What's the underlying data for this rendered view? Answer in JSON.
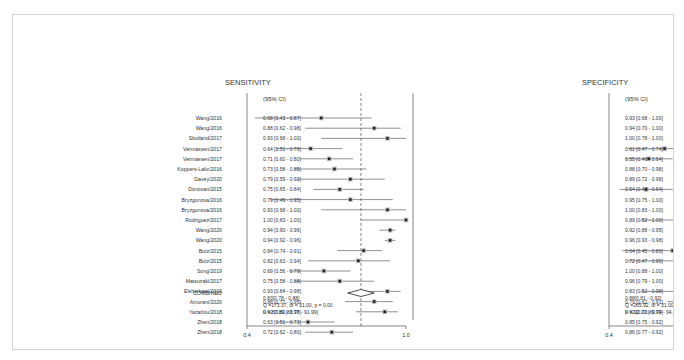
{
  "chart_data": {
    "type": "forest",
    "panels": [
      {
        "title": "SENSITIVITY",
        "ci_header": "(95% CI)",
        "xlim": [
          0.4,
          1.0
        ],
        "xticks": [
          "0.4",
          "1.0"
        ],
        "reference_line": 0.83,
        "studies": [
          {
            "label": "Wang/2016",
            "est": 0.68,
            "lo": 0.43,
            "hi": 0.87,
            "text": "0.68 [0.43 - 0.87]"
          },
          {
            "label": "Wang/2016",
            "est": 0.88,
            "lo": 0.62,
            "hi": 0.98,
            "text": "0.88 [0.62 - 0.98]"
          },
          {
            "label": "Skotland/2017",
            "est": 0.93,
            "lo": 0.68,
            "hi": 1.0,
            "text": "0.93 [0.68 - 1.00]"
          },
          {
            "label": "Vermassen/2017",
            "est": 0.64,
            "lo": 0.51,
            "hi": 0.76,
            "text": "0.64 [0.51 - 0.76]"
          },
          {
            "label": "Vermassen/2017",
            "est": 0.71,
            "lo": 0.6,
            "hi": 0.8,
            "text": "0.71 [0.60 - 0.80]"
          },
          {
            "label": "Koppers-Lalic/2016",
            "est": 0.73,
            "lo": 0.58,
            "hi": 0.85,
            "text": "0.73 [0.58 - 0.85]"
          },
          {
            "label": "Davey/2020",
            "est": 0.79,
            "lo": 0.59,
            "hi": 0.92,
            "text": "0.79 [0.59 - 0.92]"
          },
          {
            "label": "Donovan/2015",
            "est": 0.75,
            "lo": 0.65,
            "hi": 0.84,
            "text": "0.75 [0.65 - 0.84]"
          },
          {
            "label": "Bryzgunova/2016",
            "est": 0.79,
            "lo": 0.49,
            "hi": 0.95,
            "text": "0.79 [0.49 - 0.95]"
          },
          {
            "label": "Bryzgunova/2016",
            "est": 0.93,
            "lo": 0.68,
            "hi": 1.0,
            "text": "0.93 [0.68 - 1.00]"
          },
          {
            "label": "Rodriguez/2017",
            "est": 1.0,
            "lo": 0.83,
            "hi": 1.0,
            "text": "1.00 [0.83 - 1.00]"
          },
          {
            "label": "Wang/2020",
            "est": 0.94,
            "lo": 0.9,
            "hi": 0.96,
            "text": "0.94 [0.90 - 0.96]"
          },
          {
            "label": "Wang/2020",
            "est": 0.94,
            "lo": 0.92,
            "hi": 0.96,
            "text": "0.94 [0.92 - 0.96]"
          },
          {
            "label": "Butz/2015",
            "est": 0.84,
            "lo": 0.74,
            "hi": 0.91,
            "text": "0.84 [0.74 - 0.91]"
          },
          {
            "label": "Butz/2015",
            "est": 0.82,
            "lo": 0.63,
            "hi": 0.94,
            "text": "0.82 [0.63 - 0.94]"
          },
          {
            "label": "Song/2019",
            "est": 0.69,
            "lo": 0.56,
            "hi": 0.79,
            "text": "0.69 [0.56 - 0.79]"
          },
          {
            "label": "Matsuzaki/2017",
            "est": 0.75,
            "lo": 0.58,
            "hi": 0.88,
            "text": "0.75 [0.58 - 0.88]"
          },
          {
            "label": "Elsharkawi/2019",
            "est": 0.93,
            "lo": 0.84,
            "hi": 0.98,
            "text": "0.93 [0.84 - 0.98]"
          },
          {
            "label": "Amurani/2020",
            "est": 0.88,
            "lo": 0.77,
            "hi": 0.95,
            "text": "0.88 [0.77 - 0.95]"
          },
          {
            "label": "Yazarlou/2018",
            "est": 0.92,
            "lo": 0.81,
            "hi": 0.97,
            "text": "0.92 [0.81 - 0.97]"
          },
          {
            "label": "Zhen/2018",
            "est": 0.63,
            "lo": 0.51,
            "hi": 0.73,
            "text": "0.63 [0.51 - 0.73]"
          },
          {
            "label": "Zhen/2018",
            "est": 0.72,
            "lo": 0.62,
            "hi": 0.8,
            "text": "0.72 [0.62 - 0.80]"
          }
        ],
        "combined": {
          "label": "COMBINED",
          "est": 0.83,
          "lo": 0.78,
          "hi": 0.88,
          "text": "0.83[0.78 - 0.88]"
        },
        "stats": [
          "Q =173.37, df = 21.00, p = 0.00",
          "I² = 87.89 [83.78 - 91.99]"
        ]
      },
      {
        "title": "SPECIFICITY",
        "ci_header": "(95% CI)",
        "xlim": [
          0.4,
          1.0
        ],
        "xticks": [
          "0.4",
          "1.0"
        ],
        "reference_line": 0.88,
        "studies": [
          {
            "est": 0.93,
            "lo": 0.68,
            "hi": 1.0,
            "text": "0.93 [0.68 - 1.00]"
          },
          {
            "est": 0.94,
            "lo": 0.7,
            "hi": 1.0,
            "text": "0.94 [0.70 - 1.00]"
          },
          {
            "est": 1.0,
            "lo": 0.78,
            "hi": 1.0,
            "text": "1.00 [0.78 - 1.00]"
          },
          {
            "est": 0.61,
            "lo": 0.47,
            "hi": 0.74,
            "text": "0.61 [0.47 - 0.74]"
          },
          {
            "est": 0.55,
            "lo": 0.46,
            "hi": 0.64,
            "text": "0.55 [0.46 - 0.64]"
          },
          {
            "est": 0.88,
            "lo": 0.7,
            "hi": 0.98,
            "text": "0.88 [0.70 - 0.98]"
          },
          {
            "est": 0.89,
            "lo": 0.72,
            "hi": 0.98,
            "text": "0.89 [0.72 - 0.98]"
          },
          {
            "est": 0.54,
            "lo": 0.44,
            "hi": 0.64,
            "text": "0.54 [0.44 - 0.64]"
          },
          {
            "est": 0.95,
            "lo": 0.75,
            "hi": 1.0,
            "text": "0.95 [0.75 - 1.00]"
          },
          {
            "est": 1.0,
            "lo": 0.83,
            "hi": 1.0,
            "text": "1.00 [0.83 - 1.00]"
          },
          {
            "est": 0.89,
            "lo": 0.52,
            "hi": 1.0,
            "text": "0.89 [0.52 - 1.00]"
          },
          {
            "est": 0.92,
            "lo": 0.88,
            "hi": 0.95,
            "text": "0.92 [0.88 - 0.95]"
          },
          {
            "est": 0.96,
            "lo": 0.93,
            "hi": 0.98,
            "text": "0.96 [0.93 - 0.98]"
          },
          {
            "est": 0.64,
            "lo": 0.45,
            "hi": 0.8,
            "text": "0.64 [0.45 - 0.80]"
          },
          {
            "est": 0.72,
            "lo": 0.47,
            "hi": 0.9,
            "text": "0.72 [0.47 - 0.90]"
          },
          {
            "est": 1.0,
            "lo": 0.88,
            "hi": 1.0,
            "text": "1.00 [0.88 - 1.00]"
          },
          {
            "est": 0.96,
            "lo": 0.79,
            "hi": 1.0,
            "text": "0.96 [0.79 - 1.00]"
          },
          {
            "est": 0.83,
            "lo": 0.52,
            "hi": 0.98,
            "text": "0.83 [0.52 - 0.98]"
          },
          {
            "est": 0.79,
            "lo": 0.62,
            "hi": 0.91,
            "text": "0.79 [0.62 - 0.91]"
          },
          {
            "est": 0.92,
            "lo": 0.73,
            "hi": 0.99,
            "text": "0.92 [0.73 - 0.99]"
          },
          {
            "est": 0.85,
            "lo": 0.75,
            "hi": 0.92,
            "text": "0.85 [0.75 - 0.92]"
          },
          {
            "est": 0.86,
            "lo": 0.77,
            "hi": 0.92,
            "text": "0.86 [0.77 - 0.92]"
          }
        ],
        "combined": {
          "est": 0.88,
          "lo": 0.81,
          "hi": 0.92,
          "text": "0.88[0.81 - 0.92]"
        },
        "stats": [
          "Q =265.92, df = 21.00, p = 0.00",
          "I² = 92.10 [89.74 - 94.46]"
        ]
      }
    ]
  }
}
